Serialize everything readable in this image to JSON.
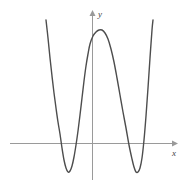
{
  "figure": {
    "kind": "cartesian-plot",
    "caption": "",
    "background_color": "#ffffff",
    "border_color": "#d8d8d8"
  },
  "axes": {
    "x_axis": {
      "label": "x",
      "color": "#9a9a9a",
      "arrow": "right",
      "y_pixel": 143,
      "x_start_pixel": 10,
      "x_end_pixel": 175
    },
    "y_axis": {
      "label": "y",
      "color": "#9a9a9a",
      "arrow": "up",
      "x_pixel": 92,
      "y_start_pixel": 180,
      "y_end_pixel": 13
    },
    "origin_pixel": [
      92,
      143
    ],
    "grid": false,
    "tick_labels": []
  },
  "chart_data": {
    "type": "line",
    "title": "",
    "xlabel": "x",
    "ylabel": "y",
    "grid": false,
    "legend": null,
    "curve_color": "#4d4d4d",
    "curve_width": 1.4,
    "degree": 4,
    "end_behavior": {
      "left": "up",
      "right": "up"
    },
    "x_intercepts": [
      -2.4,
      -0.75,
      1.08,
      2.3
    ],
    "local_minima": [
      {
        "x": -1.45,
        "y": -1.15
      },
      {
        "x": 1.75,
        "y": -1.15
      }
    ],
    "local_maxima": [
      {
        "x": 0.18,
        "y": 3.05
      }
    ],
    "y_intercept": 2.85,
    "xlim": [
      -3.5,
      3.8
    ],
    "ylim": [
      -1.6,
      4.2
    ],
    "points_pixel": [
      [
        46,
        20
      ],
      [
        48,
        38
      ],
      [
        50,
        58
      ],
      [
        52,
        76
      ],
      [
        54,
        93
      ],
      [
        56,
        108
      ],
      [
        58,
        122
      ],
      [
        60,
        134
      ],
      [
        62,
        148
      ],
      [
        64,
        160
      ],
      [
        66,
        168
      ],
      [
        68,
        172
      ],
      [
        70,
        171
      ],
      [
        72,
        166
      ],
      [
        74,
        157
      ],
      [
        76,
        145
      ],
      [
        78,
        131
      ],
      [
        80,
        115
      ],
      [
        82,
        98
      ],
      [
        84,
        81
      ],
      [
        86,
        66
      ],
      [
        88,
        54
      ],
      [
        90,
        44
      ],
      [
        93,
        36
      ],
      [
        96,
        32
      ],
      [
        99,
        30
      ],
      [
        102,
        30
      ],
      [
        105,
        33
      ],
      [
        108,
        39
      ],
      [
        111,
        49
      ],
      [
        114,
        62
      ],
      [
        117,
        78
      ],
      [
        120,
        95
      ],
      [
        123,
        112
      ],
      [
        126,
        128
      ],
      [
        129,
        145
      ],
      [
        132,
        159
      ],
      [
        134,
        167
      ],
      [
        136,
        172
      ],
      [
        138,
        172
      ],
      [
        140,
        168
      ],
      [
        142,
        158
      ],
      [
        144,
        140
      ],
      [
        146,
        116
      ],
      [
        148,
        88
      ],
      [
        150,
        58
      ],
      [
        152,
        30
      ],
      [
        153,
        20
      ]
    ]
  }
}
